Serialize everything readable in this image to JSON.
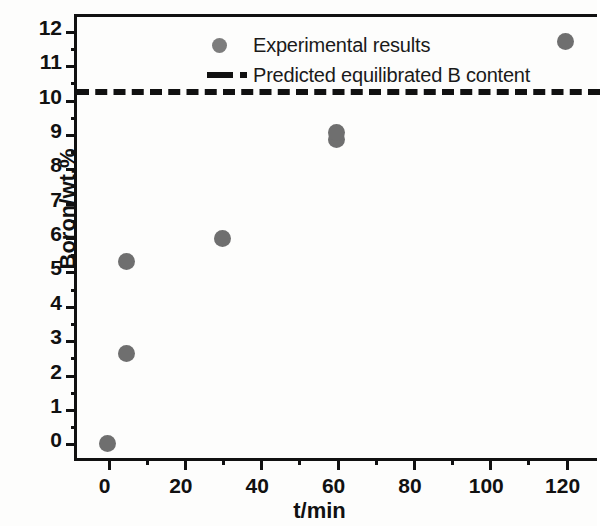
{
  "chart_data": {
    "type": "scatter",
    "title": "",
    "xlabel": "t/min",
    "ylabel": "Boron/wt.%",
    "xlim": [
      -8,
      129
    ],
    "ylim": [
      -0.6,
      12.4
    ],
    "xticks": [
      0,
      20,
      40,
      60,
      80,
      100,
      120
    ],
    "yticks": [
      0,
      1,
      2,
      3,
      4,
      5,
      6,
      7,
      8,
      9,
      10,
      11,
      12
    ],
    "xtick_labels": [
      "0",
      "20",
      "40",
      "60",
      "80",
      "100",
      "120"
    ],
    "ytick_labels": [
      "0",
      "1",
      "2",
      "3",
      "4",
      "5",
      "6",
      "7",
      "8",
      "9",
      "10",
      "11",
      "12"
    ],
    "minor_ticks": true,
    "grid": false,
    "legend_position": "top-left-inside",
    "marker_color": "#6f6f6f",
    "line_color": "#111111",
    "series": [
      {
        "name": "Experimental results",
        "type": "scatter",
        "marker": "circle",
        "color": "#6f6f6f",
        "x": [
          0,
          5,
          5,
          30,
          60,
          60,
          120
        ],
        "y": [
          0.0,
          2.6,
          5.3,
          5.95,
          8.85,
          9.05,
          11.7
        ]
      },
      {
        "name": "Predicted equilibrated B content",
        "type": "hline",
        "style": "dashed",
        "color": "#111111",
        "value": 10.3
      }
    ]
  },
  "legend": {
    "items": [
      {
        "label": "Experimental results",
        "marker": "circle-marker"
      },
      {
        "label": "Predicted equilibrated B content",
        "marker": "dashed-line-marker"
      }
    ]
  },
  "axes": {
    "x_title": "t/min",
    "y_title": "Boron/wt.%"
  }
}
